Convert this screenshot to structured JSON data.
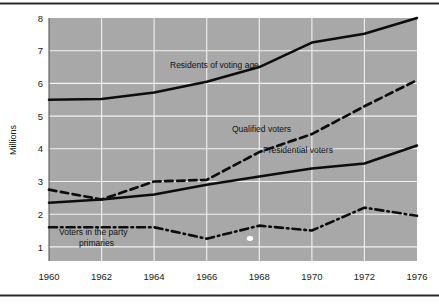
{
  "chart_data": {
    "type": "line",
    "title": "",
    "xlabel": "",
    "ylabel": "Millions",
    "x": [
      1960,
      1962,
      1964,
      1966,
      1968,
      1970,
      1972,
      1976
    ],
    "xtick_labels": [
      "1960",
      "1962",
      "1964",
      "1966",
      "1968",
      "1970",
      "1972",
      "1976"
    ],
    "ytick_labels": [
      "1",
      "2",
      "3",
      "4",
      "5",
      "6",
      "7",
      "8"
    ],
    "ylim": [
      0.55,
      8.0
    ],
    "yticks": [
      1,
      2,
      3,
      4,
      5,
      6,
      7,
      8
    ],
    "grid": true,
    "legend_position": "inline-annotations",
    "plot_background": "#a8a8a8",
    "gridline_color": "#f2f2f2",
    "line_color": "#0d0d0d",
    "series": [
      {
        "name": "Residents of voting age",
        "style": "solid",
        "label": "Residents of voting age",
        "label_x": 1963.35,
        "label_y": 6.42,
        "values": [
          5.5,
          5.52,
          5.72,
          6.05,
          6.5,
          7.25,
          7.52,
          8.0
        ]
      },
      {
        "name": "Qualified voters",
        "style": "dashed",
        "label": "Qualified voters",
        "label_x": 1965.15,
        "label_y": 4.28,
        "values": [
          2.75,
          2.45,
          3.0,
          3.05,
          3.9,
          4.45,
          5.3,
          6.1
        ]
      },
      {
        "name": "Presidential voters",
        "style": "solid",
        "label": "Presidential voters",
        "label_x": 1967.6,
        "label_y": 3.73,
        "values": [
          2.35,
          2.45,
          2.6,
          2.9,
          3.15,
          3.4,
          3.55,
          4.1
        ]
      },
      {
        "name": "Voters in the party primaries",
        "style": "dash-dot",
        "label_line_1": "Voters in the party",
        "label_line_2": "primaries",
        "label_x": 1960.35,
        "label_y": 1.47,
        "values": [
          1.6,
          1.6,
          1.6,
          1.25,
          1.65,
          1.5,
          2.2,
          1.95
        ]
      }
    ]
  }
}
